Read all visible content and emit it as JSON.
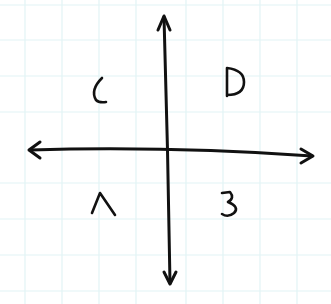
{
  "diagram": {
    "type": "quadrant-axes",
    "background": "#ffffff",
    "grid_color": "#dff2f4",
    "ink_color": "#111111",
    "axes": {
      "horizontal": "double-headed arrow",
      "vertical": "double-headed arrow"
    },
    "quadrants": {
      "top_left": "C",
      "top_right": "D",
      "bottom_left": "A",
      "bottom_right": "B"
    }
  }
}
